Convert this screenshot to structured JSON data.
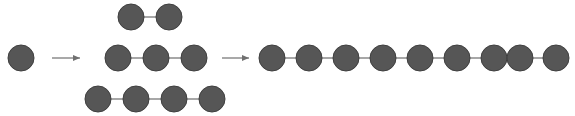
{
  "figure": {
    "width": 575,
    "height": 116,
    "background": "#ffffff",
    "node_fill": "#565656",
    "node_stroke": "#3f3f3f",
    "node_stroke_width": 1,
    "node_radius": 13,
    "edge_color": "#8a8a8a",
    "edge_width": 1.4,
    "arrow_color": "#707070",
    "arrow_width": 1.2
  },
  "diagram": {
    "type": "node-link-growth-sequence",
    "stages": [
      {
        "name": "stage-1-single-node",
        "label": "single node",
        "node_count": 1,
        "edge_count": 0,
        "rows": [
          {
            "name": "row-1",
            "node_count": 1,
            "nodes": [
              {
                "name": "node-1-1",
                "cx": 21,
                "cy": 58
              }
            ],
            "edges": []
          }
        ]
      },
      {
        "name": "stage-2-three-chains",
        "label": "three chains of 2, 3 and 4 nodes",
        "node_count": 9,
        "edge_count": 6,
        "rows": [
          {
            "name": "row-top-2-nodes",
            "node_count": 2,
            "nodes": [
              {
                "name": "node-2-top-1",
                "cx": 131,
                "cy": 17
              },
              {
                "name": "node-2-top-2",
                "cx": 169,
                "cy": 17
              }
            ],
            "edges": [
              {
                "name": "edge-2-top-1",
                "x1": 131,
                "y1": 17,
                "x2": 169,
                "y2": 17
              }
            ]
          },
          {
            "name": "row-middle-3-nodes",
            "node_count": 3,
            "nodes": [
              {
                "name": "node-2-mid-1",
                "cx": 118,
                "cy": 58
              },
              {
                "name": "node-2-mid-2",
                "cx": 156,
                "cy": 58
              },
              {
                "name": "node-2-mid-3",
                "cx": 194,
                "cy": 58
              }
            ],
            "edges": [
              {
                "name": "edge-2-mid-1",
                "x1": 118,
                "y1": 58,
                "x2": 156,
                "y2": 58
              },
              {
                "name": "edge-2-mid-2",
                "x1": 156,
                "y1": 58,
                "x2": 194,
                "y2": 58
              }
            ]
          },
          {
            "name": "row-bottom-4-nodes",
            "node_count": 4,
            "nodes": [
              {
                "name": "node-2-bot-1",
                "cx": 98,
                "cy": 99
              },
              {
                "name": "node-2-bot-2",
                "cx": 136,
                "cy": 99
              },
              {
                "name": "node-2-bot-3",
                "cx": 174,
                "cy": 99
              },
              {
                "name": "node-2-bot-4",
                "cx": 212,
                "cy": 99
              }
            ],
            "edges": [
              {
                "name": "edge-2-bot-1",
                "x1": 98,
                "y1": 99,
                "x2": 136,
                "y2": 99
              },
              {
                "name": "edge-2-bot-2",
                "x1": 136,
                "y1": 99,
                "x2": 174,
                "y2": 99
              },
              {
                "name": "edge-2-bot-3",
                "x1": 174,
                "y1": 99,
                "x2": 212,
                "y2": 99
              }
            ]
          }
        ]
      },
      {
        "name": "stage-3-long-chain",
        "label": "single chain of 9 nodes",
        "node_count": 9,
        "edge_count": 8,
        "rows": [
          {
            "name": "row-long-chain",
            "node_count": 9,
            "nodes": [
              {
                "name": "node-3-1",
                "cx": 272,
                "cy": 58
              },
              {
                "name": "node-3-2",
                "cx": 309,
                "cy": 58
              },
              {
                "name": "node-3-3",
                "cx": 346,
                "cy": 58
              },
              {
                "name": "node-3-4",
                "cx": 383,
                "cy": 58
              },
              {
                "name": "node-3-5",
                "cx": 420,
                "cy": 58
              },
              {
                "name": "node-3-6",
                "cx": 457,
                "cy": 58
              },
              {
                "name": "node-3-7",
                "cx": 494,
                "cy": 58
              },
              {
                "name": "node-3-8",
                "cx": 520,
                "cy": 58
              },
              {
                "name": "node-3-9",
                "cx": 556,
                "cy": 58
              }
            ],
            "edges": [
              {
                "name": "edge-3-1",
                "x1": 272,
                "y1": 58,
                "x2": 309,
                "y2": 58
              },
              {
                "name": "edge-3-2",
                "x1": 309,
                "y1": 58,
                "x2": 346,
                "y2": 58
              },
              {
                "name": "edge-3-3",
                "x1": 346,
                "y1": 58,
                "x2": 383,
                "y2": 58
              },
              {
                "name": "edge-3-4",
                "x1": 383,
                "y1": 58,
                "x2": 420,
                "y2": 58
              },
              {
                "name": "edge-3-5",
                "x1": 420,
                "y1": 58,
                "x2": 457,
                "y2": 58
              },
              {
                "name": "edge-3-6",
                "x1": 457,
                "y1": 58,
                "x2": 494,
                "y2": 58
              },
              {
                "name": "edge-3-7",
                "x1": 494,
                "y1": 58,
                "x2": 520,
                "y2": 58
              },
              {
                "name": "edge-3-8",
                "x1": 520,
                "y1": 58,
                "x2": 556,
                "y2": 58
              }
            ]
          }
        ]
      }
    ],
    "arrows": [
      {
        "name": "arrow-stage1-to-stage2",
        "x1": 52,
        "y1": 58,
        "x2": 80,
        "y2": 58,
        "direction": "right"
      },
      {
        "name": "arrow-stage2-to-stage3",
        "x1": 222,
        "y1": 58,
        "x2": 249,
        "y2": 58,
        "direction": "right"
      }
    ]
  }
}
